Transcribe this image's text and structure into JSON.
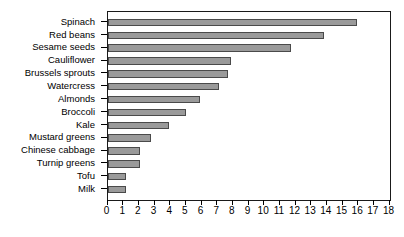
{
  "chart_data": {
    "type": "bar",
    "orientation": "horizontal",
    "title": "",
    "subtitle": "",
    "xlabel": "",
    "ylabel": "",
    "xlim": [
      0,
      18
    ],
    "ylim": null,
    "grid": false,
    "legend": null,
    "legend_position": "none",
    "bar_color": "#9a9a9a",
    "bar_border_color": "#4a4a4a",
    "axis_color": "#1a1a1a",
    "background_color": "#ffffff",
    "categories": [
      "Spinach",
      "Red beans",
      "Sesame seeds",
      "Cauliflower",
      "Brussels sprouts",
      "Watercress",
      "Almonds",
      "Broccoli",
      "Kale",
      "Mustard greens",
      "Chinese cabbage",
      "Turnip greens",
      "Tofu",
      "Milk"
    ],
    "values": [
      15.9,
      13.8,
      11.7,
      7.9,
      7.7,
      7.1,
      5.9,
      5.0,
      3.9,
      2.8,
      2.1,
      2.1,
      1.2,
      1.2
    ],
    "xticks": [
      0,
      1,
      2,
      3,
      4,
      5,
      6,
      7,
      8,
      9,
      10,
      11,
      12,
      13,
      14,
      15,
      16,
      17,
      18
    ],
    "xticklabels": [
      "0",
      "1",
      "2",
      "3",
      "4",
      "5",
      "6",
      "7",
      "8",
      "9",
      "10",
      "11",
      "12",
      "13",
      "14",
      "15",
      "16",
      "17",
      "18"
    ]
  }
}
